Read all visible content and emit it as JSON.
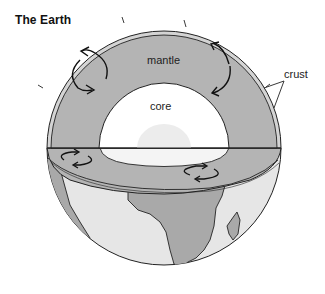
{
  "title": "The Earth",
  "labels": {
    "mantle": "mantle",
    "core": "core",
    "crust": "crust"
  },
  "colors": {
    "mantle": "#b4b4b4",
    "crust_band": "#d4d4d4",
    "core": "#ffffff",
    "inner_core": "#ececec",
    "land": "#a9a9a9",
    "ocean": "#e6e6e6",
    "outline": "#222222"
  }
}
